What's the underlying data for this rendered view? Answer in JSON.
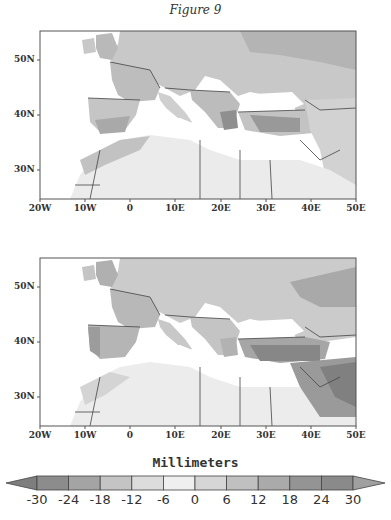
{
  "figure": {
    "title": "Figure 9"
  },
  "maps": [
    {
      "id": "top",
      "lat_ticks": [
        "50N",
        "40N",
        "30N"
      ],
      "lon_ticks": [
        "20W",
        "10W",
        "0",
        "10E",
        "20E",
        "30E",
        "40E",
        "50E"
      ]
    },
    {
      "id": "bottom",
      "lat_ticks": [
        "50N",
        "40N",
        "30N"
      ],
      "lon_ticks": [
        "20W",
        "10W",
        "0",
        "10E",
        "20E",
        "30E",
        "40E",
        "50E"
      ]
    }
  ],
  "colorbar": {
    "title": "Millimeters",
    "labels": [
      "-30",
      "-24",
      "-18",
      "-12",
      "-6",
      "0",
      "6",
      "12",
      "18",
      "24",
      "30"
    ],
    "colors": [
      "#8c8c8c",
      "#a4a4a4",
      "#c4c4c4",
      "#dcdcdc",
      "#efefef",
      "#d6d6d6",
      "#c0c0c0",
      "#aaaaaa",
      "#949494",
      "#8a8a8a"
    ],
    "under_color": "#7e7e7e",
    "over_color": "#a0a0a0"
  }
}
